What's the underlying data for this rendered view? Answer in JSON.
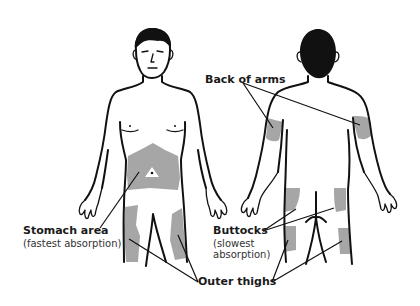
{
  "diagram": {
    "views": [
      "front",
      "back"
    ],
    "zone_color": "#a6a6a6",
    "line_color": "#111111"
  },
  "labels": {
    "back_of_arms": {
      "title": "Back of arms"
    },
    "stomach_area": {
      "title": "Stomach area",
      "sub": "(fastest absorption)"
    },
    "buttocks": {
      "title": "Buttocks",
      "sub_line1": "(slowest",
      "sub_line2": "absorption)"
    },
    "outer_thighs": {
      "title": "Outer thighs"
    }
  }
}
